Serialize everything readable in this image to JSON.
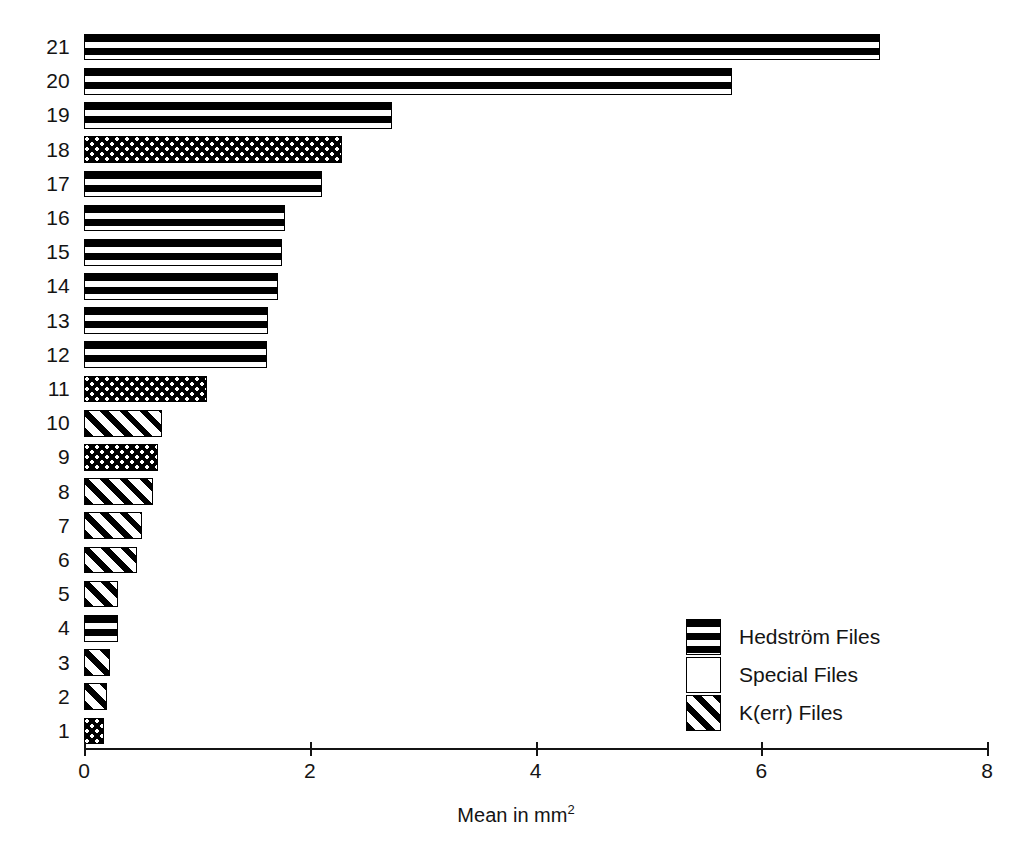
{
  "chart_data": {
    "type": "bar",
    "orientation": "horizontal",
    "title": "",
    "subtitle": "",
    "xlabel": "Mean in mm2",
    "xlabel_html": "Mean in mm<sup>2</sup>",
    "ylabel": "",
    "xlim": [
      0,
      8
    ],
    "x_ticks": [
      0,
      2,
      4,
      6,
      8
    ],
    "x_tick_labels": [
      "0",
      "2",
      "4",
      "6",
      "8"
    ],
    "grid": false,
    "legend_position": "inside-lower-right",
    "categories": [
      "1",
      "2",
      "3",
      "4",
      "5",
      "6",
      "7",
      "8",
      "9",
      "10",
      "11",
      "12",
      "13",
      "14",
      "15",
      "16",
      "17",
      "18",
      "19",
      "20",
      "21"
    ],
    "values": [
      0.18,
      0.2,
      0.23,
      0.3,
      0.3,
      0.47,
      0.51,
      0.61,
      0.66,
      0.69,
      1.09,
      1.62,
      1.63,
      1.72,
      1.75,
      1.78,
      2.11,
      2.29,
      2.73,
      5.74,
      7.05
    ],
    "groups": [
      "special",
      "kerr",
      "kerr",
      "hedstrom",
      "kerr",
      "kerr",
      "kerr",
      "kerr",
      "special",
      "kerr",
      "special",
      "hedstrom",
      "hedstrom",
      "hedstrom",
      "hedstrom",
      "hedstrom",
      "hedstrom",
      "special",
      "hedstrom",
      "hedstrom",
      "hedstrom"
    ],
    "bars": [
      {
        "category": "21",
        "value": 7.05,
        "group": "hedstrom"
      },
      {
        "category": "20",
        "value": 5.74,
        "group": "hedstrom"
      },
      {
        "category": "19",
        "value": 2.73,
        "group": "hedstrom"
      },
      {
        "category": "18",
        "value": 2.29,
        "group": "special"
      },
      {
        "category": "17",
        "value": 2.11,
        "group": "hedstrom"
      },
      {
        "category": "16",
        "value": 1.78,
        "group": "hedstrom"
      },
      {
        "category": "15",
        "value": 1.75,
        "group": "hedstrom"
      },
      {
        "category": "14",
        "value": 1.72,
        "group": "hedstrom"
      },
      {
        "category": "13",
        "value": 1.63,
        "group": "hedstrom"
      },
      {
        "category": "12",
        "value": 1.62,
        "group": "hedstrom"
      },
      {
        "category": "11",
        "value": 1.09,
        "group": "special"
      },
      {
        "category": "10",
        "value": 0.69,
        "group": "kerr"
      },
      {
        "category": "9",
        "value": 0.66,
        "group": "special"
      },
      {
        "category": "8",
        "value": 0.61,
        "group": "kerr"
      },
      {
        "category": "7",
        "value": 0.51,
        "group": "kerr"
      },
      {
        "category": "6",
        "value": 0.47,
        "group": "kerr"
      },
      {
        "category": "5",
        "value": 0.3,
        "group": "kerr"
      },
      {
        "category": "4",
        "value": 0.3,
        "group": "hedstrom"
      },
      {
        "category": "3",
        "value": 0.23,
        "group": "kerr"
      },
      {
        "category": "2",
        "value": 0.2,
        "group": "kerr"
      },
      {
        "category": "1",
        "value": 0.18,
        "group": "special"
      }
    ],
    "legend": [
      {
        "key": "hedstrom",
        "label": "Hedström Files",
        "pattern": "horizontal-stripes"
      },
      {
        "key": "special",
        "label": "Special Files",
        "pattern": "stipple-dots"
      },
      {
        "key": "kerr",
        "label": "K(err) Files",
        "pattern": "diagonal-hatch"
      }
    ],
    "colors": {
      "ink": "#000000",
      "background": "#ffffff",
      "axis": "#141414"
    }
  }
}
